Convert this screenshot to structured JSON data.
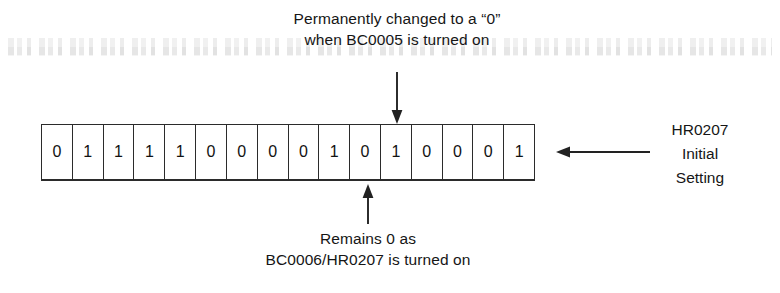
{
  "figure": {
    "background_color": "#ffffff",
    "line_color": "#2b2b2b",
    "text_color": "#161616"
  },
  "register": {
    "name": "HR0207",
    "bit_count": 16,
    "bits": [
      "0",
      "1",
      "1",
      "1",
      "1",
      "0",
      "0",
      "0",
      "0",
      "1",
      "0",
      "1",
      "0",
      "0",
      "0",
      "1"
    ],
    "bit_string": "0111100001010001"
  },
  "top_annotation": {
    "line1": "Permanently changed to a “0”",
    "line2": "when BC0005 is turned on",
    "points_to_bit_index": 11,
    "points_to_bit_value": "1"
  },
  "bottom_annotation": {
    "line1": "Remains 0 as",
    "line2": "BC0006/HR0207 is turned on",
    "points_to_bit_index": 10,
    "points_to_bit_value": "0"
  },
  "right_label": {
    "line1": "HR0207",
    "line2": "Initial",
    "line3": "Setting"
  }
}
